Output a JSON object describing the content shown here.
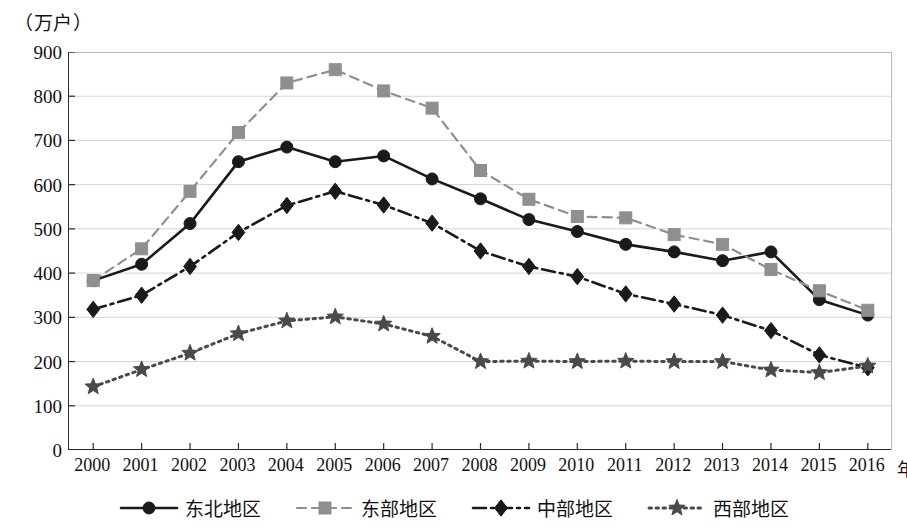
{
  "unit_label": "（万户）",
  "x_axis_name": "年份",
  "y_ticks": [
    "0",
    "100",
    "200",
    "300",
    "400",
    "500",
    "600",
    "700",
    "800",
    "900"
  ],
  "legend": [
    {
      "label": "东北地区",
      "marker": "circle",
      "line": "solid",
      "color": "#1a1a1a"
    },
    {
      "label": "东部地区",
      "marker": "square",
      "line": "dashed",
      "color": "#8f8f8f"
    },
    {
      "label": "中部地区",
      "marker": "diamond",
      "line": "dashdot",
      "color": "#1a1a1a"
    },
    {
      "label": "西部地区",
      "marker": "star",
      "line": "dotted",
      "color": "#4a4a4a"
    }
  ],
  "chart_data": {
    "type": "line",
    "title": "",
    "xlabel": "年份",
    "ylabel": "（万户）",
    "ylim": [
      0,
      900
    ],
    "ytick_step": 100,
    "grid": true,
    "legend_position": "bottom",
    "categories": [
      "2000",
      "2001",
      "2002",
      "2003",
      "2004",
      "2005",
      "2006",
      "2007",
      "2008",
      "2009",
      "2010",
      "2011",
      "2012",
      "2013",
      "2014",
      "2015",
      "2016"
    ],
    "series": [
      {
        "name": "东北地区",
        "marker": "circle",
        "linestyle": "solid",
        "color": "#1a1a1a",
        "values": [
          383,
          420,
          512,
          652,
          685,
          652,
          665,
          613,
          568,
          521,
          494,
          465,
          448,
          428,
          448,
          340,
          305
        ]
      },
      {
        "name": "东部地区",
        "marker": "square",
        "linestyle": "dashed",
        "color": "#8f8f8f",
        "values": [
          383,
          455,
          585,
          718,
          830,
          860,
          812,
          773,
          632,
          567,
          528,
          525,
          487,
          465,
          408,
          360,
          316
        ]
      },
      {
        "name": "中部地区",
        "marker": "diamond",
        "linestyle": "dashdot",
        "color": "#1a1a1a",
        "values": [
          318,
          350,
          415,
          492,
          553,
          585,
          554,
          513,
          450,
          415,
          392,
          353,
          330,
          305,
          270,
          215,
          186
        ]
      },
      {
        "name": "西部地区",
        "marker": "star",
        "linestyle": "dotted",
        "color": "#4a4a4a",
        "values": [
          143,
          182,
          219,
          263,
          292,
          301,
          285,
          257,
          200,
          201,
          200,
          201,
          200,
          200,
          181,
          175,
          190
        ]
      }
    ]
  }
}
